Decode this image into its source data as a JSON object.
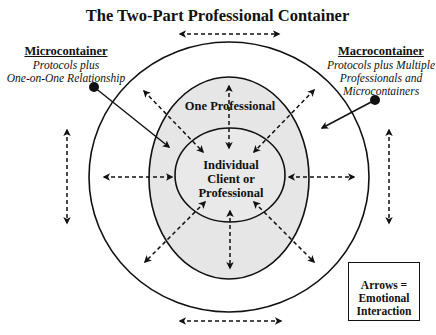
{
  "title": "The Two-Part Professional Container",
  "microcontainer": {
    "heading": "Microcontainer",
    "line1": "Protocols plus",
    "line2": "One-on-One Relationship"
  },
  "macrocontainer": {
    "heading": "Macrocontainer",
    "line1": "Protocols plus Multiple",
    "line2": "Professionals and",
    "line3": "Microcontainers"
  },
  "middle_ring_label": "One Professional",
  "core_label": {
    "line1": "Individual",
    "line2": "Client or",
    "line3": "Professional"
  },
  "legend": {
    "line1": "Arrows =",
    "line2": "Emotional",
    "line3": "Interaction"
  },
  "colors": {
    "stroke": "#111111",
    "shaded_fill": "#e6e6e6",
    "background": "#ffffff"
  }
}
